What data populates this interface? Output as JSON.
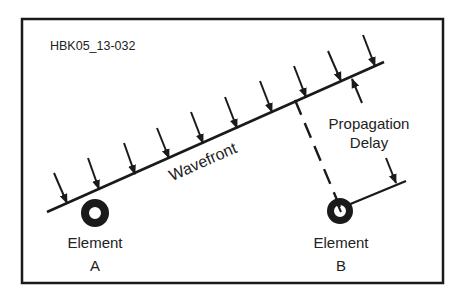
{
  "figure_id": "HBK05_13-032",
  "colors": {
    "ink": "#1a1a1a",
    "text": "#222222",
    "background": "#ffffff"
  },
  "labels": {
    "wavefront": "Wavefront",
    "propagation": "Propagation",
    "delay": "Delay",
    "element_a_line1": "Element",
    "element_a_line2": "A",
    "element_b_line1": "Element",
    "element_b_line2": "B"
  },
  "diagram": {
    "frame": {
      "x": 22,
      "y": 19,
      "w": 421,
      "h": 264
    },
    "wavefront_line": {
      "x1": 47,
      "y1": 212,
      "x2": 384,
      "y2": 62
    },
    "incident_arrows": [
      {
        "x1": 54,
        "y1": 173,
        "x2": 67,
        "y2": 203
      },
      {
        "x1": 88,
        "y1": 158,
        "x2": 99,
        "y2": 189
      },
      {
        "x1": 124,
        "y1": 143,
        "x2": 135,
        "y2": 174
      },
      {
        "x1": 157,
        "y1": 128,
        "x2": 169,
        "y2": 158
      },
      {
        "x1": 191,
        "y1": 112,
        "x2": 203,
        "y2": 143
      },
      {
        "x1": 225,
        "y1": 97,
        "x2": 237,
        "y2": 128
      },
      {
        "x1": 260,
        "y1": 81,
        "x2": 272,
        "y2": 112
      },
      {
        "x1": 294,
        "y1": 66,
        "x2": 306,
        "y2": 97
      },
      {
        "x1": 328,
        "y1": 51,
        "x2": 341,
        "y2": 81
      },
      {
        "x1": 363,
        "y1": 35,
        "x2": 375,
        "y2": 66
      }
    ],
    "elements": [
      {
        "id": "A",
        "cx": 95,
        "cy": 213,
        "r_outer": 14,
        "r_inner": 6
      },
      {
        "id": "B",
        "cx": 340,
        "cy": 211,
        "r_outer": 13,
        "r_inner": 6
      }
    ],
    "dashed_line": {
      "x1": 295,
      "y1": 100,
      "x2": 340,
      "y2": 207
    },
    "delayed_wavefront_line": {
      "x1": 348,
      "y1": 205,
      "x2": 406,
      "y2": 181
    },
    "delay_arrow_upper": {
      "x1": 362,
      "y1": 103,
      "x2": 352,
      "y2": 79
    },
    "delay_arrow_lower": {
      "x1": 386,
      "y1": 158,
      "x2": 396,
      "y2": 183
    }
  }
}
